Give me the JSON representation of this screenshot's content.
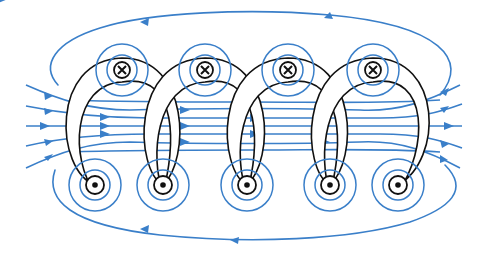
{
  "diagram": {
    "colors": {
      "field_line": "#3a7fc9",
      "wire": "#111111",
      "background": "#ffffff"
    },
    "wire_into_page": {
      "symbol": "⊗",
      "label": "current into page",
      "positions": [
        [
          122,
          70
        ],
        [
          205,
          70
        ],
        [
          288,
          70
        ],
        [
          373,
          70
        ]
      ]
    },
    "wire_out_of_page": {
      "symbol": "⊙",
      "label": "current out of page",
      "positions": [
        [
          95,
          185
        ],
        [
          163,
          185
        ],
        [
          247,
          185
        ],
        [
          330,
          185
        ],
        [
          398,
          185
        ]
      ]
    },
    "field_direction": "left-to-right inside solenoid; returns right-to-left outside",
    "turns": 5
  }
}
